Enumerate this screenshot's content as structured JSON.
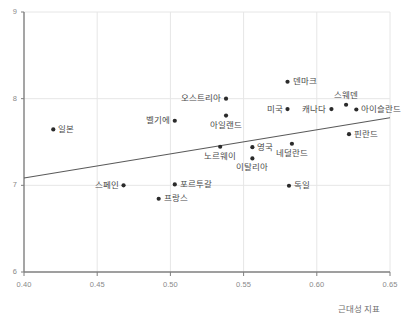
{
  "chart_data": {
    "type": "scatter",
    "title": "",
    "xlabel": "근대성 지표",
    "ylabel": "",
    "xlim": [
      0.4,
      0.65
    ],
    "ylim": [
      6,
      9
    ],
    "xticks": [
      "0.40",
      "0.45",
      "0.50",
      "0.55",
      "0.60",
      "0.65"
    ],
    "yticks": [
      "9",
      "8",
      "7",
      "6"
    ],
    "grid": true,
    "legend": "none",
    "point_color": "#2b2b2b",
    "line_color": "#5a5a5a",
    "grid_color": "#e6e6e6",
    "axis_color": "#7f7f7f",
    "points": [
      {
        "label": "일본",
        "x": 0.42,
        "y": 7.645,
        "pos": "right"
      },
      {
        "label": "벨기에",
        "x": 0.503,
        "y": 7.745,
        "pos": "left"
      },
      {
        "label": "오스트리아",
        "x": 0.538,
        "y": 8.0,
        "pos": "left"
      },
      {
        "label": "아일랜드",
        "x": 0.538,
        "y": 7.805,
        "pos": "below"
      },
      {
        "label": "덴마크",
        "x": 0.58,
        "y": 8.195,
        "pos": "right"
      },
      {
        "label": "미국",
        "x": 0.58,
        "y": 7.88,
        "pos": "left"
      },
      {
        "label": "캐나다",
        "x": 0.61,
        "y": 7.88,
        "pos": "left"
      },
      {
        "label": "스웨덴",
        "x": 0.62,
        "y": 7.93,
        "pos": "above"
      },
      {
        "label": "아이슬란드",
        "x": 0.627,
        "y": 7.875,
        "pos": "right"
      },
      {
        "label": "핀란드",
        "x": 0.622,
        "y": 7.59,
        "pos": "right"
      },
      {
        "label": "네덜란드",
        "x": 0.583,
        "y": 7.48,
        "pos": "below"
      },
      {
        "label": "영국",
        "x": 0.556,
        "y": 7.44,
        "pos": "right"
      },
      {
        "label": "노르웨이",
        "x": 0.534,
        "y": 7.445,
        "pos": "below"
      },
      {
        "label": "이탈리아",
        "x": 0.556,
        "y": 7.31,
        "pos": "below"
      },
      {
        "label": "스페인",
        "x": 0.468,
        "y": 7.0,
        "pos": "left"
      },
      {
        "label": "포르투갈",
        "x": 0.503,
        "y": 7.01,
        "pos": "right"
      },
      {
        "label": "독일",
        "x": 0.581,
        "y": 6.995,
        "pos": "right"
      },
      {
        "label": "프랑스",
        "x": 0.492,
        "y": 6.845,
        "pos": "right"
      }
    ],
    "trendline": {
      "x0": 0.4,
      "y0": 7.085,
      "x1": 0.65,
      "y1": 7.78
    }
  }
}
